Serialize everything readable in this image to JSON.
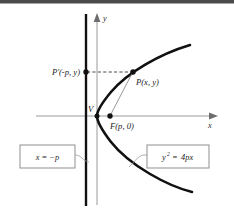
{
  "figure": {
    "type": "geometry-diagram",
    "background_color": "#ffffff",
    "top_band_color": "#4a4a4a"
  },
  "axes": {
    "x_label": "x",
    "y_label": "y",
    "axis_color": "#9a9a9a",
    "origin_px": {
      "x": 97,
      "y": 116
    }
  },
  "curve": {
    "name": "parabola",
    "color": "#111111",
    "opens": "right",
    "vertex_px": {
      "x": 97,
      "y": 116
    }
  },
  "directrix": {
    "color": "#111111",
    "x_px": 86
  },
  "points": [
    {
      "id": "P-prime",
      "label": "P'(-p, y)",
      "label_parts": {
        "name": "P′",
        "coords": "(−p, y)"
      },
      "px": {
        "x": 86,
        "y": 72
      },
      "label_anchor": "right"
    },
    {
      "id": "P",
      "label": "P(x, y)",
      "label_parts": {
        "name": "P",
        "coords": "(x, y)"
      },
      "px": {
        "x": 133,
        "y": 72
      },
      "label_anchor": "below-right"
    },
    {
      "id": "F",
      "label": "F(p, 0)",
      "label_parts": {
        "name": "F",
        "coords": "(p, 0)"
      },
      "px": {
        "x": 110,
        "y": 116
      },
      "label_anchor": "below-right"
    },
    {
      "id": "V",
      "label": "V",
      "px": {
        "x": 97,
        "y": 116
      },
      "label_anchor": "above-left"
    }
  ],
  "segments": [
    {
      "id": "P-prime-to-P",
      "style": "dashed",
      "color": "#4a4a4a"
    },
    {
      "id": "P-to-F",
      "style": "solid-thin",
      "color": "#8c8c8c"
    }
  ],
  "callouts": [
    {
      "id": "directrix-equation",
      "text": "x = −p",
      "text_parts": {
        "lhs": "x",
        "eq": "=",
        "rhs": "−p"
      },
      "box_px": {
        "x": 20,
        "y": 145,
        "w": 55,
        "h": 23
      },
      "border_color": "#8f8f8f",
      "fill": "#ffffff"
    },
    {
      "id": "parabola-equation",
      "text": "y² = 4px",
      "text_parts": {
        "base": "y",
        "exponent": "2",
        "eq": "=",
        "rhs": "4px"
      },
      "box_px": {
        "x": 147,
        "y": 145,
        "w": 62,
        "h": 23
      },
      "border_color": "#8f8f8f",
      "fill": "#ffffff"
    }
  ]
}
